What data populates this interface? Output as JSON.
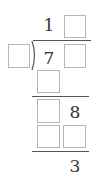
{
  "puzzle": {
    "type": "long-division",
    "quotient": {
      "digit1": "1",
      "digit2": ""
    },
    "divisor": {
      "digit1": ""
    },
    "dividend": {
      "digit1": "7",
      "digit2": ""
    },
    "step1_product": {
      "digit1": ""
    },
    "step1_remainder": {
      "digit1": "",
      "digit2": "8"
    },
    "step2_product": {
      "digit1": "",
      "digit2": ""
    },
    "remainder": {
      "digit1": "3"
    }
  },
  "colors": {
    "box_border": "#b5b5b5",
    "text": "#333333",
    "line": "#555555"
  }
}
